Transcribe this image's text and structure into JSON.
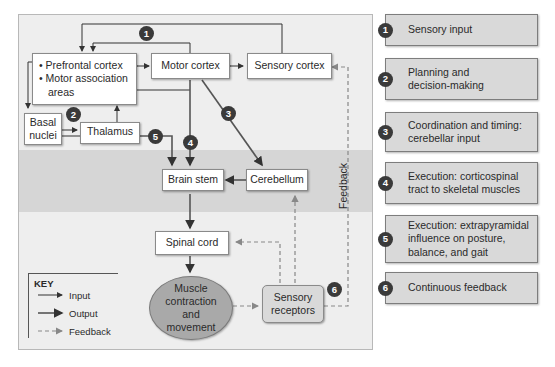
{
  "diagram": {
    "nodes": {
      "prefrontal": [
        "Prefrontal cortex",
        "Motor association areas"
      ],
      "motor_cortex": "Motor cortex",
      "sensory_cortex": "Sensory cortex",
      "basal_nuclei": "Basal nuclei",
      "thalamus": "Thalamus",
      "brain_stem": "Brain stem",
      "cerebellum": "Cerebellum",
      "spinal_cord": "Spinal cord",
      "muscle": "Muscle contraction and movement",
      "sensory_receptors": "Sensory receptors"
    },
    "feedback_label": "Feedback",
    "badges": [
      "1",
      "2",
      "3",
      "4",
      "5",
      "6"
    ],
    "key": {
      "title": "KEY",
      "items": [
        {
          "label": "Input",
          "style": "thin-solid"
        },
        {
          "label": "Output",
          "style": "thick-solid"
        },
        {
          "label": "Feedback",
          "style": "dashed"
        }
      ]
    }
  },
  "legend": [
    {
      "num": "1",
      "text": "Sensory input"
    },
    {
      "num": "2",
      "text": "Planning and decision-making"
    },
    {
      "num": "3",
      "text": "Coordination and timing: cerebellar input"
    },
    {
      "num": "4",
      "text": "Execution: corticospinal tract to skeletal muscles"
    },
    {
      "num": "5",
      "text": "Execution: extrapyramidal influence on posture, balance, and gait"
    },
    {
      "num": "6",
      "text": "Continuous feedback"
    }
  ],
  "colors": {
    "panel": "#eeeeee",
    "band": "#d6d6d6",
    "badge": "#3a3a3a",
    "legend_box": "#d9d9d9",
    "oval": "#a9a9a9"
  }
}
